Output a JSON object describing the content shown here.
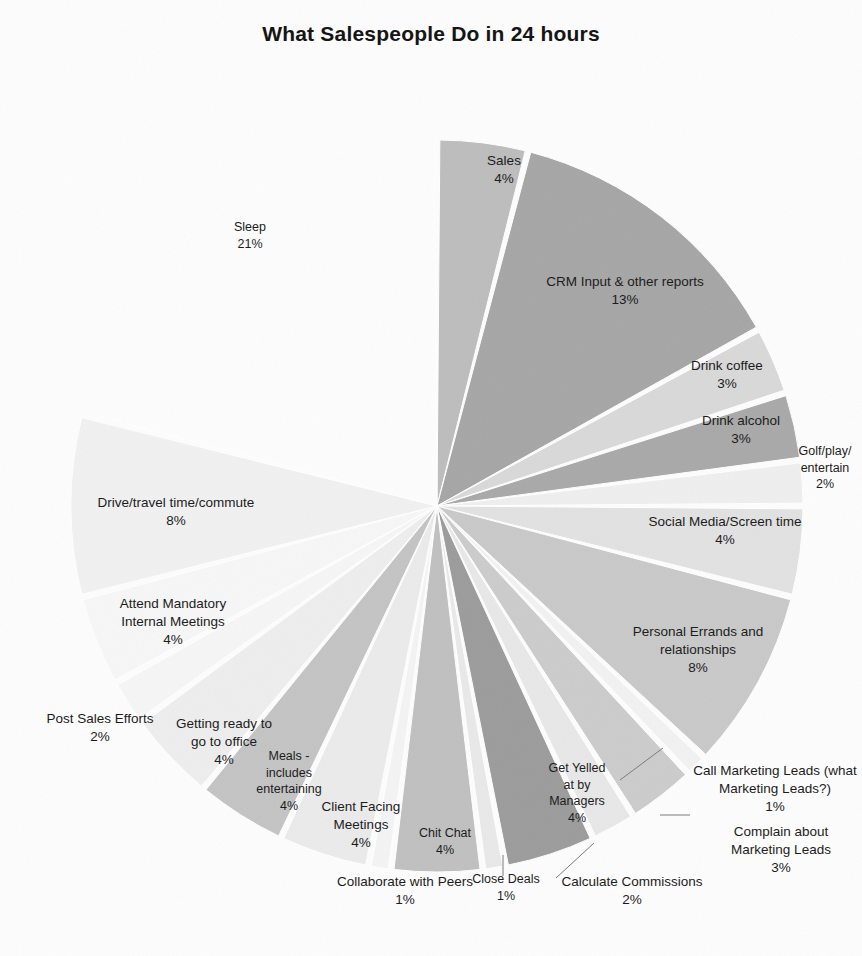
{
  "chart_data": {
    "type": "pie",
    "title": "What Salespeople Do in 24 hours",
    "xlabel": "",
    "ylabel": "",
    "legend_position": "none",
    "labels_position": "outside-and-inside",
    "units": "percent",
    "total": 100,
    "categories": [
      "Sales",
      "CRM Input & other reports",
      "Drink coffee",
      "Drink alcohol",
      "Golf/play/entertain",
      "Social Media/Screen time",
      "Personal Errands and relationships",
      "Call Marketing Leads (what Marketing Leads?)",
      "Complain about Marketing Leads",
      "Calculate Commissions",
      "Get Yelled at by Managers",
      "Close Deals",
      "Chit Chat",
      "Collaborate with Peers",
      "Client Facing Meetings",
      "Meals - includes entertaining",
      "Getting ready to go to office",
      "Post Sales Efforts",
      "Attend Mandatory Internal Meetings",
      "Drive/travel time/commute",
      "Sleep"
    ],
    "values": [
      4,
      13,
      3,
      3,
      2,
      4,
      8,
      1,
      3,
      2,
      4,
      1,
      4,
      1,
      4,
      4,
      4,
      2,
      4,
      8,
      21
    ],
    "colors": [
      "#bdbdbd",
      "#a6a6a6",
      "#d9d9d9",
      "#a9a9a9",
      "#efefef",
      "#e2e2e2",
      "#c9c9c9",
      "#f2f2f2",
      "#cccccc",
      "#e8e8e8",
      "#9c9c9c",
      "#e9e9e9",
      "#c0c0c0",
      "#f4f4f4",
      "#ebebeb",
      "#c4c4c4",
      "#eeeeee",
      "#f6f6f6",
      "#f7f7f7",
      "#f1f1f1",
      "#fdfdfd"
    ],
    "slices": [
      {
        "name": "Sales",
        "pct": 4,
        "label": "Sales",
        "pct_text": "4%",
        "color": "#bdbdbd"
      },
      {
        "name": "CRM Input & other reports",
        "pct": 13,
        "label": "CRM Input & other reports",
        "pct_text": "13%",
        "color": "#a6a6a6"
      },
      {
        "name": "Drink coffee",
        "pct": 3,
        "label": "Drink coffee",
        "pct_text": "3%",
        "color": "#d9d9d9"
      },
      {
        "name": "Drink alcohol",
        "pct": 3,
        "label": "Drink alcohol",
        "pct_text": "3%",
        "color": "#a9a9a9"
      },
      {
        "name": "Golf/play/entertain",
        "pct": 2,
        "label": "Golf/play/\nentertain",
        "pct_text": "2%",
        "color": "#efefef"
      },
      {
        "name": "Social Media/Screen time",
        "pct": 4,
        "label": "Social Media/Screen time",
        "pct_text": "4%",
        "color": "#e2e2e2"
      },
      {
        "name": "Personal Errands and relationships",
        "pct": 8,
        "label": "Personal Errands and\nrelationships",
        "pct_text": "8%",
        "color": "#c9c9c9"
      },
      {
        "name": "Call Marketing Leads (what Marketing Leads?)",
        "pct": 1,
        "label": "Call Marketing Leads (what\nMarketing Leads?)",
        "pct_text": "1%",
        "color": "#f2f2f2"
      },
      {
        "name": "Complain about Marketing Leads",
        "pct": 3,
        "label": "Complain about\nMarketing Leads",
        "pct_text": "3%",
        "color": "#cccccc"
      },
      {
        "name": "Calculate Commissions",
        "pct": 2,
        "label": "Calculate Commissions",
        "pct_text": "2%",
        "color": "#e8e8e8"
      },
      {
        "name": "Get Yelled at by Managers",
        "pct": 4,
        "label": "Get Yelled\nat by\nManagers",
        "pct_text": "4%",
        "color": "#9c9c9c"
      },
      {
        "name": "Close Deals",
        "pct": 1,
        "label": "Close Deals",
        "pct_text": "1%",
        "color": "#e9e9e9"
      },
      {
        "name": "Chit Chat",
        "pct": 4,
        "label": "Chit Chat",
        "pct_text": "4%",
        "color": "#c0c0c0"
      },
      {
        "name": "Collaborate with Peers",
        "pct": 1,
        "label": "Collaborate with Peers",
        "pct_text": "1%",
        "color": "#f4f4f4"
      },
      {
        "name": "Client Facing Meetings",
        "pct": 4,
        "label": "Client Facing\nMeetings",
        "pct_text": "4%",
        "color": "#ebebeb"
      },
      {
        "name": "Meals - includes entertaining",
        "pct": 4,
        "label": "Meals -\nincludes\nentertaining",
        "pct_text": "4%",
        "color": "#c4c4c4"
      },
      {
        "name": "Getting ready to go to office",
        "pct": 4,
        "label": "Getting ready to\ngo to office",
        "pct_text": "4%",
        "color": "#eeeeee"
      },
      {
        "name": "Post Sales Efforts",
        "pct": 2,
        "label": "Post Sales Efforts",
        "pct_text": "2%",
        "color": "#f6f6f6"
      },
      {
        "name": "Attend Mandatory Internal Meetings",
        "pct": 4,
        "label": "Attend Mandatory\nInternal Meetings",
        "pct_text": "4%",
        "color": "#f7f7f7"
      },
      {
        "name": "Drive/travel time/commute",
        "pct": 8,
        "label": "Drive/travel time/commute",
        "pct_text": "8%",
        "color": "#f1f1f1"
      },
      {
        "name": "Sleep",
        "pct": 21,
        "label": "Sleep",
        "pct_text": "21%",
        "color": "#fdfdfd"
      }
    ]
  },
  "geometry": {
    "cx": 437,
    "cy": 506,
    "r": 366,
    "start_angle_deg": -90,
    "direction": "clockwise"
  },
  "labels": [
    {
      "key": "sales",
      "text": "Sales",
      "pct": "4%",
      "x": 444,
      "y": 152,
      "w": 120,
      "align": "center"
    },
    {
      "key": "crm",
      "text": "CRM Input & other reports",
      "pct": "13%",
      "x": 520,
      "y": 273,
      "w": 210,
      "align": "center"
    },
    {
      "key": "coffee",
      "text": "Drink coffee",
      "pct": "3%",
      "x": 662,
      "y": 357,
      "w": 130,
      "align": "center"
    },
    {
      "key": "alcohol",
      "text": "Drink alcohol",
      "pct": "3%",
      "x": 676,
      "y": 412,
      "w": 130,
      "align": "center"
    },
    {
      "key": "golf",
      "text": "Golf/play/\nentertain",
      "pct": "2%",
      "x": 780,
      "y": 443,
      "w": 90,
      "align": "center"
    },
    {
      "key": "social",
      "text": "Social Media/Screen time",
      "pct": "4%",
      "x": 620,
      "y": 513,
      "w": 210,
      "align": "center"
    },
    {
      "key": "errands",
      "text": "Personal Errands and\nrelationships",
      "pct": "8%",
      "x": 608,
      "y": 623,
      "w": 180,
      "align": "center"
    },
    {
      "key": "callleads",
      "text": "Call Marketing Leads (what\nMarketing Leads?)",
      "pct": "1%",
      "x": 686,
      "y": 762,
      "w": 178,
      "align": "center"
    },
    {
      "key": "complain",
      "text": "Complain about\nMarketing Leads",
      "pct": "3%",
      "x": 706,
      "y": 823,
      "w": 150,
      "align": "center"
    },
    {
      "key": "commissions",
      "text": "Calculate Commissions",
      "pct": "2%",
      "x": 547,
      "y": 873,
      "w": 170,
      "align": "center"
    },
    {
      "key": "yelled",
      "text": "Get Yelled\nat by\nManagers",
      "pct": "4%",
      "x": 529,
      "y": 760,
      "w": 96,
      "align": "center"
    },
    {
      "key": "closedeals",
      "text": "Close Deals",
      "pct": "1%",
      "x": 461,
      "y": 871,
      "w": 90,
      "align": "center"
    },
    {
      "key": "chitchat",
      "text": "Chit Chat",
      "pct": "4%",
      "x": 400,
      "y": 825,
      "w": 90,
      "align": "center"
    },
    {
      "key": "collaborate",
      "text": "Collaborate with Peers",
      "pct": "1%",
      "x": 320,
      "y": 873,
      "w": 170,
      "align": "center"
    },
    {
      "key": "clientfacing",
      "text": "Client Facing\nMeetings",
      "pct": "4%",
      "x": 306,
      "y": 798,
      "w": 110,
      "align": "center"
    },
    {
      "key": "meals",
      "text": "Meals -\nincludes\nentertaining",
      "pct": "4%",
      "x": 243,
      "y": 748,
      "w": 92,
      "align": "center"
    },
    {
      "key": "gettingready",
      "text": "Getting ready to\ngo to office",
      "pct": "4%",
      "x": 159,
      "y": 715,
      "w": 130,
      "align": "center"
    },
    {
      "key": "postsales",
      "text": "Post Sales Efforts",
      "pct": "2%",
      "x": 30,
      "y": 710,
      "w": 140,
      "align": "center"
    },
    {
      "key": "mandatory",
      "text": "Attend Mandatory\nInternal Meetings",
      "pct": "4%",
      "x": 98,
      "y": 595,
      "w": 150,
      "align": "center"
    },
    {
      "key": "drive",
      "text": "Drive/travel time/commute",
      "pct": "8%",
      "x": 78,
      "y": 494,
      "w": 196,
      "align": "center"
    },
    {
      "key": "sleep",
      "text": "Sleep",
      "pct": "21%",
      "x": 205,
      "y": 219,
      "w": 90,
      "align": "center"
    }
  ],
  "leader_lines": [
    {
      "key": "leader-callleads",
      "x1": 663,
      "y1": 748,
      "x2": 620,
      "y2": 780
    },
    {
      "key": "leader-complain",
      "x1": 690,
      "y1": 815,
      "x2": 660,
      "y2": 815
    },
    {
      "key": "leader-commissions",
      "x1": 594,
      "y1": 843,
      "x2": 556,
      "y2": 878
    },
    {
      "key": "leader-closedeals",
      "x1": 503,
      "y1": 855,
      "x2": 503,
      "y2": 876
    }
  ]
}
